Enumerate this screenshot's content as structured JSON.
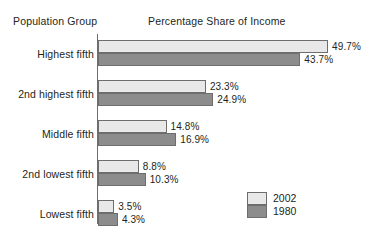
{
  "headings": {
    "group": "Population Group",
    "value": "Percentage Share of Income"
  },
  "legend": {
    "position": "inside-bottom-right",
    "entries": [
      {
        "label": "2002",
        "color": "#e8e8e8"
      },
      {
        "label": "1980",
        "color": "#8c8c8c"
      }
    ]
  },
  "colors": {
    "series_2002": "#e8e8e8",
    "series_1980": "#8c8c8c",
    "bar_border": "#6d6d6d",
    "text": "#231f20",
    "background": "#ffffff"
  },
  "chart_data": {
    "type": "bar",
    "orientation": "horizontal",
    "title": "Percentage Share of Income",
    "xlabel": "Percentage Share of Income",
    "ylabel": "Population Group",
    "grid": false,
    "legend_position": "inside-bottom-right",
    "xlim": [
      0,
      50
    ],
    "categories": [
      "Highest fifth",
      "2nd highest fifth",
      "Middle fifth",
      "2nd lowest fifth",
      "Lowest fifth"
    ],
    "series": [
      {
        "name": "2002",
        "color": "#e8e8e8",
        "values": [
          49.7,
          23.3,
          14.8,
          8.8,
          3.5
        ],
        "labels": [
          "49.7%",
          "23.3%",
          "14.8%",
          "8.8%",
          "3.5%"
        ]
      },
      {
        "name": "1980",
        "color": "#8c8c8c",
        "values": [
          43.7,
          24.9,
          16.9,
          10.3,
          4.3
        ],
        "labels": [
          "43.7%",
          "24.9%",
          "16.9%",
          "10.3%",
          "4.3%"
        ]
      }
    ]
  },
  "scale": {
    "px_per_unit": 4.63,
    "origin_x": 98
  },
  "rows": [
    {
      "top": 40
    },
    {
      "top": 80
    },
    {
      "top": 120
    },
    {
      "top": 160
    },
    {
      "top": 200
    }
  ]
}
